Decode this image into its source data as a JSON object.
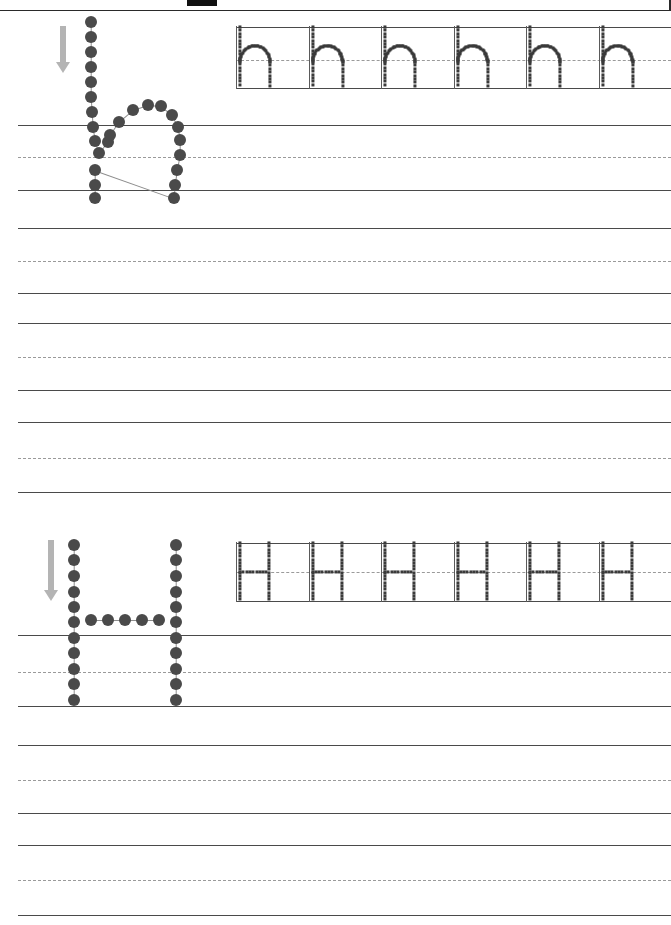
{
  "page": {
    "type": "handwriting-practice-worksheet",
    "width": 671,
    "height": 925,
    "background_color": "#ffffff",
    "rule_color": "#4a4a4a",
    "dashed_rule_color": "#9a9a9a",
    "dot_color": "#4a4a4a",
    "trace_dot_color": "#3a3a3a",
    "arrow_color": "#b4b4b4",
    "frame_color": "#2a2a2a"
  },
  "header": {
    "has_top_frame": true,
    "redaction_block": {
      "x": 187,
      "y": 0,
      "width": 30,
      "height": 6,
      "color": "#111111"
    }
  },
  "sections": [
    {
      "id": "lowercase-h",
      "letter": "h",
      "case": "lowercase",
      "model": {
        "label": "h",
        "stroke_direction": "down",
        "arrow": {
          "x": 56,
          "y": 26,
          "length": 36
        },
        "dot_count": 25
      },
      "trace_row": {
        "letter": "h",
        "repeats": 6,
        "separators": 6,
        "baseline_y": 88,
        "top_y": 27,
        "midline_y": 60
      },
      "blank_rows": 1
    },
    {
      "id": "uppercase-H",
      "letter": "H",
      "case": "uppercase",
      "model": {
        "label": "H",
        "stroke_direction": "down",
        "arrow": {
          "x": 44,
          "y": 540,
          "length": 50
        },
        "dot_count": 31
      },
      "trace_row": {
        "letter": "H",
        "repeats": 6,
        "separators": 6,
        "baseline_y": 601,
        "top_y": 543,
        "midline_y": 572
      },
      "blank_rows": 1
    }
  ],
  "ruled_rows": [
    {
      "name": "row-1-section-1-line-2",
      "top": 125,
      "mid": 157,
      "bottom": 190,
      "group": "lowercase-practice"
    },
    {
      "name": "row-2-blank",
      "top": 228,
      "mid": 261,
      "bottom": 293,
      "group": "blank"
    },
    {
      "name": "row-3-blank",
      "top": 323,
      "mid": 357,
      "bottom": 390,
      "group": "blank"
    },
    {
      "name": "row-4-blank",
      "top": 422,
      "mid": 458,
      "bottom": 492,
      "group": "blank"
    },
    {
      "name": "row-5-section-2-line-2",
      "top": 635,
      "mid": 672,
      "bottom": 706,
      "group": "uppercase-practice"
    },
    {
      "name": "row-6-blank",
      "top": 745,
      "mid": 780,
      "bottom": 813,
      "group": "blank"
    },
    {
      "name": "row-7-blank",
      "top": 845,
      "mid": 880,
      "bottom": 915,
      "group": "blank"
    }
  ],
  "trace_row_rules": [
    {
      "name": "trace-rule-top-h",
      "y": 27
    },
    {
      "name": "trace-rule-mid-h",
      "y": 60
    },
    {
      "name": "trace-rule-bottom-h",
      "y": 88
    },
    {
      "name": "trace-rule-top-H",
      "y": 543
    },
    {
      "name": "trace-rule-mid-H",
      "y": 572
    },
    {
      "name": "trace-rule-bottom-H",
      "y": 601
    }
  ],
  "model_h_dots": [
    [
      91,
      22
    ],
    [
      91,
      37
    ],
    [
      91,
      52
    ],
    [
      91,
      67
    ],
    [
      91,
      82
    ],
    [
      91,
      97
    ],
    [
      92,
      112
    ],
    [
      93,
      127
    ],
    [
      95,
      141
    ],
    [
      99,
      153
    ],
    [
      108,
      142
    ],
    [
      110,
      135
    ],
    [
      119,
      122
    ],
    [
      133,
      110
    ],
    [
      148,
      105
    ],
    [
      161,
      106
    ],
    [
      172,
      115
    ],
    [
      178,
      127
    ],
    [
      180,
      140
    ],
    [
      180,
      155
    ],
    [
      177,
      170
    ],
    [
      175,
      185
    ],
    [
      174,
      198
    ],
    [
      95,
      170
    ],
    [
      95,
      185
    ],
    [
      95,
      198
    ]
  ],
  "model_H_dots": [
    [
      74,
      545
    ],
    [
      74,
      560
    ],
    [
      74,
      576
    ],
    [
      74,
      592
    ],
    [
      74,
      607
    ],
    [
      74,
      622
    ],
    [
      74,
      638
    ],
    [
      74,
      653
    ],
    [
      74,
      669
    ],
    [
      74,
      684
    ],
    [
      74,
      700
    ],
    [
      176,
      545
    ],
    [
      176,
      560
    ],
    [
      176,
      576
    ],
    [
      176,
      592
    ],
    [
      176,
      607
    ],
    [
      176,
      622
    ],
    [
      176,
      638
    ],
    [
      176,
      653
    ],
    [
      176,
      669
    ],
    [
      176,
      684
    ],
    [
      176,
      700
    ],
    [
      91,
      620
    ],
    [
      108,
      620
    ],
    [
      125,
      620
    ],
    [
      142,
      620
    ],
    [
      159,
      620
    ]
  ]
}
